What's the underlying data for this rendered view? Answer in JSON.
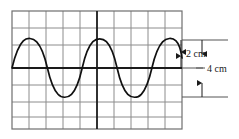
{
  "figure": {
    "name": "waveform-on-grid-diagram",
    "background_color": "#ffffff",
    "grid": {
      "x": 12,
      "y": 11,
      "width": 170,
      "height": 118,
      "columns": 10,
      "rows": 7,
      "cell_size": 17,
      "minor_line_color": "#8c8c8c",
      "border_color": "#6e6e6e",
      "axis_color": "#1a1a1a",
      "axis_horizontal_y": 68,
      "axis_vertical_x": 97
    },
    "waveform": {
      "type": "sine",
      "stroke_color": "#111111",
      "stroke_width": 1.6,
      "center_y": 68,
      "peak_y": 40,
      "trough_y": 97,
      "amplitude_px": 28,
      "period_px": 67,
      "cycles": 2.5,
      "start_x": 12,
      "end_x": 182,
      "phase_peak_x": 30
    },
    "annotations": [
      {
        "name": "amplitude-label",
        "text": "2 cm",
        "text_x": 186,
        "text_y": 57,
        "arrow_x": 181,
        "arrow_top_y": 40,
        "arrow_bottom_y": 68,
        "color": "#1a1a1a"
      },
      {
        "name": "peak-to-peak-label",
        "text": "4 cm",
        "text_x": 207,
        "text_y": 72,
        "arrow_x": 202,
        "arrow_top_y": 40,
        "arrow_bottom_y": 97,
        "color": "#1a1a1a"
      }
    ],
    "leader_lines": [
      {
        "name": "leader-line-peak",
        "x1": 182,
        "y1": 40,
        "x2": 228,
        "y2": 40
      },
      {
        "name": "leader-line-center",
        "x1": 182,
        "y1": 68,
        "x2": 203,
        "y2": 68
      },
      {
        "name": "leader-line-trough",
        "x1": 182,
        "y1": 97,
        "x2": 228,
        "y2": 97
      },
      {
        "name": "leader-line-dash-4cm",
        "x1": 196,
        "y1": 68,
        "x2": 204,
        "y2": 68
      }
    ]
  }
}
